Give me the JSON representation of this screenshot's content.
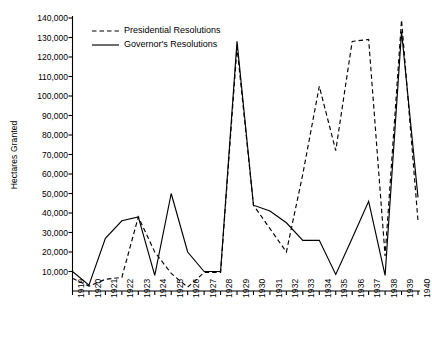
{
  "chart_data": {
    "type": "line",
    "title": "",
    "xlabel": "",
    "ylabel": "Hectares Granted",
    "x": [
      1919,
      1920,
      1921,
      1922,
      1923,
      1924,
      1925,
      1926,
      1927,
      1928,
      1929,
      1930,
      1931,
      1932,
      1933,
      1934,
      1935,
      1936,
      1937,
      1938,
      1939,
      1940
    ],
    "xtick_labels": [
      "1919",
      "1920",
      "1921",
      "1922",
      "1923",
      "1924",
      "1925",
      "1926",
      "1927",
      "1928",
      "1929",
      "1930",
      "1931",
      "1932",
      "1933",
      "1934",
      "1935",
      "1936",
      "1937",
      "1938",
      "1939",
      "1940"
    ],
    "ytick_labels": [
      "10,000",
      "20,000",
      "30,000",
      "40,000",
      "50,000",
      "60,000",
      "70,000",
      "80,000",
      "90,000",
      "100,000",
      "110,000",
      "120,000",
      "130,000",
      "140,000"
    ],
    "ytick_values": [
      10000,
      20000,
      30000,
      40000,
      50000,
      60000,
      70000,
      80000,
      90000,
      100000,
      110000,
      120000,
      130000,
      140000
    ],
    "ylim": [
      0,
      140000
    ],
    "xlim": [
      1919,
      1940
    ],
    "grid": false,
    "legend_position": "top-left",
    "series": [
      {
        "name": "Presidential Resolutions",
        "style": "dashed",
        "color": "#000000",
        "values": [
          6500,
          2500,
          6000,
          7000,
          38000,
          20000,
          9000,
          2000,
          9500,
          9500,
          125000,
          44000,
          32000,
          20000,
          60000,
          105000,
          72000,
          128000,
          129000,
          18000,
          139000,
          36000
        ]
      },
      {
        "name": "Governor's Resolutions",
        "style": "solid",
        "color": "#000000",
        "values": [
          10000,
          3000,
          27000,
          36000,
          38000,
          8000,
          50000,
          20000,
          10000,
          10000,
          128000,
          44000,
          41000,
          35000,
          26000,
          26000,
          8500,
          27000,
          46000,
          8000,
          133000,
          48000
        ]
      }
    ]
  },
  "legend": {
    "items": [
      {
        "label": "Presidential Resolutions",
        "style": "dashed"
      },
      {
        "label": "Governor's Resolutions",
        "style": "solid"
      }
    ]
  },
  "axis": {
    "y_title": "Hectares Granted"
  }
}
